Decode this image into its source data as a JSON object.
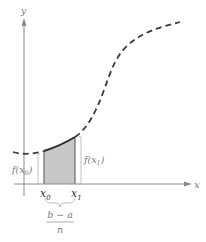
{
  "figure": {
    "type": "riemann-trapezoid-diagram",
    "axes": {
      "x_label": "x",
      "y_label": "y"
    },
    "points": {
      "x0_label": "x",
      "x0_sub": "0",
      "x1_label": "x",
      "x1_sub": "1"
    },
    "function_labels": {
      "f_x0_prefix": "f(x",
      "f_x0_sub": "0",
      "f_x0_suffix": ")",
      "f_x1_prefix": "f(x",
      "f_x1_sub": "1",
      "f_x1_suffix": ")"
    },
    "width_label": {
      "numerator": "b − a",
      "denominator": "n"
    },
    "colors": {
      "curve": "#3a3a3a",
      "axis": "#8a8a8a",
      "shade": "#c8c8c8",
      "label": "#7a7a7a"
    }
  }
}
